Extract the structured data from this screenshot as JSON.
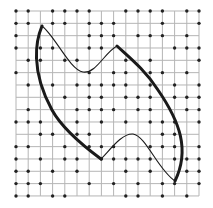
{
  "figure": {
    "grid": {
      "columns": 16,
      "rows": 16,
      "x0": 16,
      "y0": 11,
      "dx": 12.2,
      "dy": 12.33,
      "line_color": "#b5b5b5",
      "dot_color": "#222222"
    },
    "dots": [
      [
        0,
        0
      ],
      [
        1,
        0
      ],
      [
        3,
        0
      ],
      [
        4,
        0
      ],
      [
        5,
        0
      ],
      [
        6,
        0
      ],
      [
        9,
        0
      ],
      [
        10,
        0
      ],
      [
        11,
        0
      ],
      [
        12,
        0
      ],
      [
        14,
        0
      ],
      [
        15,
        0
      ],
      [
        0,
        1
      ],
      [
        1,
        1
      ],
      [
        3,
        1
      ],
      [
        4,
        1
      ],
      [
        6,
        1
      ],
      [
        7,
        1
      ],
      [
        8,
        1
      ],
      [
        12,
        1
      ],
      [
        15,
        1
      ],
      [
        0,
        2
      ],
      [
        6,
        2
      ],
      [
        7,
        2
      ],
      [
        8,
        2
      ],
      [
        10,
        2
      ],
      [
        11,
        2
      ],
      [
        12,
        2
      ],
      [
        14,
        2
      ],
      [
        0,
        3
      ],
      [
        2,
        3
      ],
      [
        3,
        3
      ],
      [
        6,
        3
      ],
      [
        7,
        3
      ],
      [
        13,
        3
      ],
      [
        14,
        3
      ],
      [
        15,
        3
      ],
      [
        1,
        4
      ],
      [
        2,
        4
      ],
      [
        4,
        4
      ],
      [
        5,
        4
      ],
      [
        9,
        4
      ],
      [
        11,
        4
      ],
      [
        15,
        4
      ],
      [
        0,
        5
      ],
      [
        6,
        5
      ],
      [
        8,
        5
      ],
      [
        9,
        5
      ],
      [
        11,
        5
      ],
      [
        12,
        5
      ],
      [
        14,
        5
      ],
      [
        1,
        6
      ],
      [
        3,
        6
      ],
      [
        5,
        6
      ],
      [
        6,
        6
      ],
      [
        7,
        6
      ],
      [
        8,
        6
      ],
      [
        9,
        6
      ],
      [
        11,
        6
      ],
      [
        13,
        6
      ],
      [
        15,
        6
      ],
      [
        4,
        7
      ],
      [
        6,
        7
      ],
      [
        7,
        7
      ],
      [
        9,
        7
      ],
      [
        10,
        7
      ],
      [
        11,
        7
      ],
      [
        13,
        7
      ],
      [
        14,
        7
      ],
      [
        15,
        7
      ],
      [
        1,
        8
      ],
      [
        5,
        8
      ],
      [
        6,
        8
      ],
      [
        7,
        8
      ],
      [
        8,
        8
      ],
      [
        10,
        8
      ],
      [
        11,
        8
      ],
      [
        14,
        8
      ],
      [
        15,
        8
      ],
      [
        0,
        9
      ],
      [
        1,
        9
      ],
      [
        2,
        9
      ],
      [
        5,
        9
      ],
      [
        7,
        9
      ],
      [
        9,
        9
      ],
      [
        11,
        9
      ],
      [
        12,
        9
      ],
      [
        13,
        9
      ],
      [
        15,
        9
      ],
      [
        2,
        10
      ],
      [
        3,
        10
      ],
      [
        5,
        10
      ],
      [
        6,
        10
      ],
      [
        12,
        10
      ],
      [
        13,
        10
      ],
      [
        0,
        11
      ],
      [
        1,
        11
      ],
      [
        4,
        11
      ],
      [
        6,
        11
      ],
      [
        7,
        11
      ],
      [
        8,
        11
      ],
      [
        11,
        11
      ],
      [
        12,
        11
      ],
      [
        13,
        11
      ],
      [
        15,
        11
      ],
      [
        0,
        12
      ],
      [
        2,
        12
      ],
      [
        4,
        12
      ],
      [
        5,
        12
      ],
      [
        7,
        12
      ],
      [
        8,
        12
      ],
      [
        9,
        12
      ],
      [
        10,
        12
      ],
      [
        11,
        12
      ],
      [
        13,
        12
      ],
      [
        14,
        12
      ],
      [
        15,
        12
      ],
      [
        0,
        13
      ],
      [
        1,
        13
      ],
      [
        3,
        13
      ],
      [
        5,
        13
      ],
      [
        9,
        13
      ],
      [
        11,
        13
      ],
      [
        14,
        13
      ],
      [
        15,
        13
      ],
      [
        0,
        14
      ],
      [
        1,
        14
      ],
      [
        2,
        14
      ],
      [
        6,
        14
      ],
      [
        8,
        14
      ],
      [
        10,
        14
      ],
      [
        12,
        14
      ],
      [
        13,
        14
      ],
      [
        15,
        14
      ],
      [
        0,
        15
      ],
      [
        1,
        15
      ],
      [
        3,
        15
      ],
      [
        4,
        15
      ],
      [
        9,
        15
      ],
      [
        10,
        15
      ],
      [
        12,
        15
      ],
      [
        14,
        15
      ]
    ],
    "shape": {
      "thick_left_arc": "M42,26 C36,40 30,70 52,110 C62,128 82,145 101,159",
      "thin_top_curve": "M42,26 C55,36 70,70 83,72 C96,74 105,52 117,46",
      "thin_mid_curve": "M101,159 C110,150 122,133 133,134 C146,136 158,170 175,181",
      "thick_right_arc": "M117,46 C130,58 145,70 158,90 C180,122 190,150 175,181",
      "stroke_color": "#1a1a1a",
      "thick_width": 3,
      "thin_width": 1.1
    }
  }
}
